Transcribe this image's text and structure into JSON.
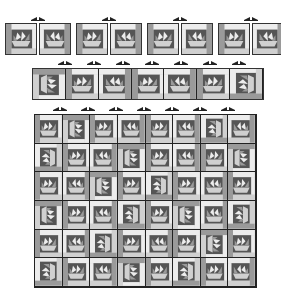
{
  "diagram": {
    "title": "",
    "colors": {
      "dark": "#555555",
      "medium": "#9a9a9a",
      "light": "#d0d0d0",
      "lightest": "#ececec",
      "outline": "#333333"
    },
    "stage1": {
      "name": "block-pairs",
      "blocks": [
        {
          "x": 5,
          "y": 23,
          "w": 32,
          "h": 32,
          "orientation": "A"
        },
        {
          "x": 39,
          "y": 23,
          "w": 32,
          "h": 32,
          "orientation": "B"
        },
        {
          "x": 76,
          "y": 23,
          "w": 32,
          "h": 32,
          "orientation": "A"
        },
        {
          "x": 110,
          "y": 23,
          "w": 32,
          "h": 32,
          "orientation": "B"
        },
        {
          "x": 147,
          "y": 23,
          "w": 32,
          "h": 32,
          "orientation": "A"
        },
        {
          "x": 181,
          "y": 23,
          "w": 32,
          "h": 32,
          "orientation": "B"
        },
        {
          "x": 218,
          "y": 23,
          "w": 32,
          "h": 32,
          "orientation": "A"
        },
        {
          "x": 252,
          "y": 23,
          "w": 32,
          "h": 32,
          "orientation": "B"
        }
      ],
      "arrows": [
        {
          "x": 31,
          "y": 17
        },
        {
          "x": 102,
          "y": 17
        },
        {
          "x": 173,
          "y": 17
        },
        {
          "x": 244,
          "y": 17
        }
      ]
    },
    "stage2": {
      "name": "row-strip",
      "x": 32,
      "y": 68,
      "w": 232,
      "h": 32,
      "blocks": [
        "C",
        "A",
        "B",
        "A",
        "B",
        "A",
        "D"
      ],
      "arrows": [
        {
          "x": 58,
          "y": 61
        },
        {
          "x": 87,
          "y": 61
        },
        {
          "x": 116,
          "y": 61
        },
        {
          "x": 145,
          "y": 61
        },
        {
          "x": 174,
          "y": 61
        },
        {
          "x": 203,
          "y": 61
        },
        {
          "x": 232,
          "y": 61
        }
      ]
    },
    "stage3": {
      "name": "quilt-top",
      "x": 34,
      "y": 114,
      "w": 223,
      "h": 174,
      "cols": 8,
      "rows": 6,
      "arrows": [
        {
          "x": 53,
          "y": 107
        },
        {
          "x": 81,
          "y": 107
        },
        {
          "x": 109,
          "y": 107
        },
        {
          "x": 137,
          "y": 107
        },
        {
          "x": 165,
          "y": 107
        },
        {
          "x": 193,
          "y": 107
        },
        {
          "x": 221,
          "y": 107
        }
      ],
      "pattern": [
        [
          "A",
          "C",
          "A",
          "B",
          "A",
          "B",
          "D",
          "B"
        ],
        [
          "D",
          "A",
          "B",
          "C",
          "A",
          "B",
          "A",
          "C"
        ],
        [
          "A",
          "B",
          "C",
          "A",
          "D",
          "A",
          "B",
          "A"
        ],
        [
          "C",
          "A",
          "B",
          "D",
          "A",
          "C",
          "B",
          "D"
        ],
        [
          "A",
          "B",
          "D",
          "A",
          "B",
          "A",
          "C",
          "A"
        ],
        [
          "D",
          "A",
          "B",
          "C",
          "A",
          "D",
          "A",
          "B"
        ]
      ]
    }
  }
}
